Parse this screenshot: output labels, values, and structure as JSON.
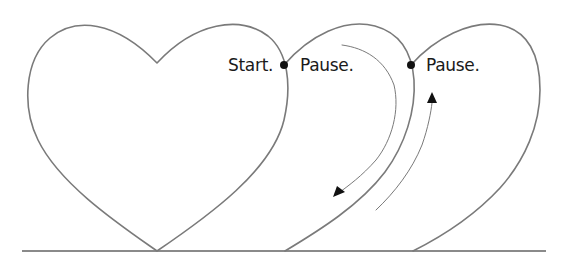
{
  "diagram": {
    "colors": {
      "outline": "#7a7a7a",
      "markers": "#111111",
      "text": "#1a1a1a",
      "background": "#ffffff"
    },
    "labels": {
      "start": "Start.",
      "pause_1": "Pause.",
      "pause_2": "Pause."
    },
    "shapes": [
      {
        "name": "heart-1",
        "type": "full-heart"
      },
      {
        "name": "heart-2",
        "type": "partial-heart-right-lobe"
      },
      {
        "name": "heart-3",
        "type": "partial-heart-right-lobe"
      }
    ],
    "markers": [
      {
        "name": "start-point",
        "label_ref": "start"
      },
      {
        "name": "pause-point-1",
        "label_ref": "pause_1"
      },
      {
        "name": "pause-point-2",
        "label_ref": "pause_2"
      }
    ],
    "arrows": [
      {
        "name": "down-arrow",
        "direction": "downward"
      },
      {
        "name": "up-arrow",
        "direction": "upward"
      }
    ]
  }
}
